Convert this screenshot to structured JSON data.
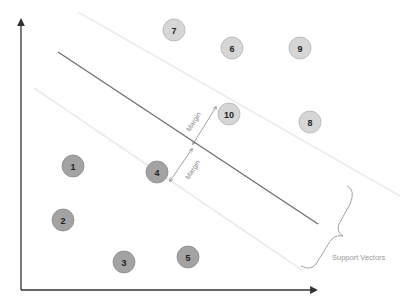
{
  "diagram": {
    "type": "svm-hyperplane",
    "colors": {
      "axis": "#333333",
      "hyperplane": "#6e6e6e",
      "margin_line": "#ececec",
      "class_a_fill": "#a3a3a3",
      "class_a_stroke": "#8c8c8c",
      "class_b_fill": "#d6d6d6",
      "class_b_stroke": "#b3b3b3",
      "annotation": "#888888"
    },
    "points": [
      {
        "id": "1",
        "label": "1",
        "class": "a",
        "x": 73,
        "y": 166
      },
      {
        "id": "2",
        "label": "2",
        "class": "a",
        "x": 63,
        "y": 220
      },
      {
        "id": "3",
        "label": "3",
        "class": "a",
        "x": 124,
        "y": 262
      },
      {
        "id": "4",
        "label": "4",
        "class": "a",
        "x": 157,
        "y": 172
      },
      {
        "id": "5",
        "label": "5",
        "class": "a",
        "x": 188,
        "y": 257
      },
      {
        "id": "6",
        "label": "6",
        "class": "b",
        "x": 232,
        "y": 48
      },
      {
        "id": "7",
        "label": "7",
        "class": "b",
        "x": 174,
        "y": 30
      },
      {
        "id": "8",
        "label": "8",
        "class": "b",
        "x": 310,
        "y": 122
      },
      {
        "id": "9",
        "label": "9",
        "class": "b",
        "x": 300,
        "y": 48
      },
      {
        "id": "10",
        "label": "10",
        "class": "b",
        "x": 229,
        "y": 114
      }
    ],
    "annotations": {
      "margin_upper": "Margin",
      "margin_lower": "Margin",
      "support_vectors": "Support Vectors"
    }
  }
}
